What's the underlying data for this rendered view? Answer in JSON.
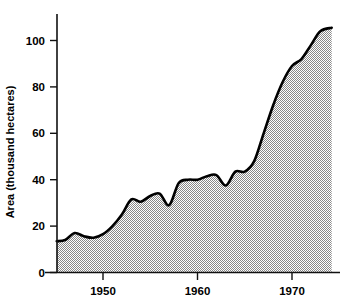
{
  "chart_data": {
    "type": "area",
    "title": "",
    "xlabel": "",
    "ylabel": "Area (thousand hectares)",
    "xlim": [
      1945,
      1974.2
    ],
    "ylim": [
      0,
      110
    ],
    "xticks": [
      1950,
      1960,
      1970
    ],
    "xtick_labels": [
      "1950",
      "1960",
      "1970"
    ],
    "yticks": [
      0,
      20,
      40,
      60,
      80,
      100
    ],
    "ytick_labels": [
      "0",
      "20",
      "40",
      "60",
      "80",
      "100"
    ],
    "grid": false,
    "legend": "none",
    "series_name": "Area under crop",
    "fill_pattern": "checkerboard-dither-gray",
    "fill_color": "#a8a8a8",
    "line_color": "#000000",
    "x": [
      1945.1,
      1946,
      1947,
      1948,
      1949,
      1950,
      1951,
      1952,
      1953,
      1954,
      1955,
      1956,
      1957,
      1958,
      1959,
      1960,
      1961,
      1962,
      1963,
      1964,
      1965,
      1966,
      1967,
      1968,
      1969,
      1970,
      1971,
      1972,
      1973,
      1974.2
    ],
    "values": [
      13.5,
      14.0,
      17.0,
      15.6,
      15.0,
      16.5,
      20.0,
      25.0,
      31.5,
      30.5,
      33.0,
      34.0,
      29.0,
      38.5,
      40.0,
      40.0,
      41.5,
      42.0,
      37.5,
      43.5,
      43.5,
      48.0,
      60.0,
      72.0,
      82.0,
      89.0,
      92.0,
      98.0,
      104.0,
      105.5
    ],
    "axis_ticks_y_labels": {
      "t0": "0",
      "t20": "20",
      "t40": "40",
      "t60": "60",
      "t80": "80",
      "t100": "100"
    },
    "axis_ticks_x_labels": {
      "t1950": "1950",
      "t1960": "1960",
      "t1970": "1970"
    }
  }
}
